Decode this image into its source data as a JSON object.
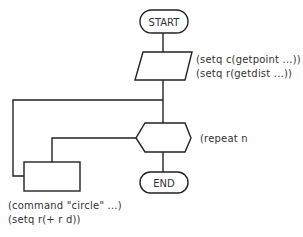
{
  "diagram": {
    "type": "flowchart",
    "nodes": {
      "start": {
        "label": "START",
        "shape": "terminator"
      },
      "input": {
        "label": "",
        "shape": "parallelogram",
        "annotations": [
          "(setq  c(getpoint  ...))",
          "(setq  r(getdist  ...))"
        ]
      },
      "loop": {
        "label": "",
        "shape": "hexagon",
        "annotation": "(repeat  n"
      },
      "process": {
        "label": "",
        "shape": "rectangle",
        "annotations": [
          "(command  \"circle\"  ...)",
          "(setq  r(+  r  d))"
        ]
      },
      "end": {
        "label": "END",
        "shape": "terminator"
      }
    },
    "edges": [
      {
        "from": "start",
        "to": "input"
      },
      {
        "from": "input",
        "to": "loop"
      },
      {
        "from": "loop",
        "to": "process"
      },
      {
        "from": "process",
        "to": "loop"
      },
      {
        "from": "loop",
        "to": "end"
      }
    ]
  }
}
